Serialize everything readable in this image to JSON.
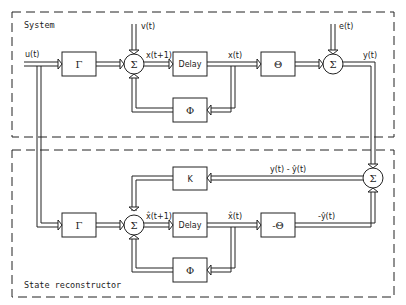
{
  "sections": {
    "system": {
      "label": "System"
    },
    "reconstructor": {
      "label": "State reconstructor"
    }
  },
  "system": {
    "gamma": "Γ",
    "sum1": "Σ",
    "delay": "Delay",
    "theta": "Θ",
    "sum2": "Σ",
    "phi": "Φ",
    "signals": {
      "u": "u(t)",
      "v": "v(t)",
      "x_next": "x(t+1)",
      "x": "x(t)",
      "e": "e(t)",
      "y": "y(t)"
    }
  },
  "reconstructor": {
    "k": "K",
    "gamma": "Γ",
    "sum3": "Σ",
    "delay": "Delay",
    "neg_theta": "-Θ",
    "phi": "Φ",
    "sum4": "Σ",
    "signals": {
      "innovation": "y(t) - ŷ(t)",
      "xhat_next": "x̂(t+1)",
      "xhat": "x̂(t)",
      "neg_yhat": "-ŷ(t)"
    }
  },
  "colors": {
    "line": "#222222",
    "background": "#ffffff"
  }
}
